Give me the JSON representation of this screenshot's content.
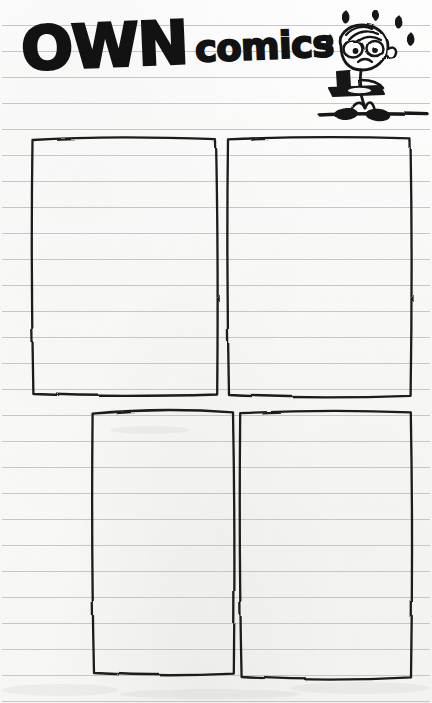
{
  "page": {
    "kind": "draw-your-own-comics-worksheet",
    "width": 432,
    "height": 703,
    "paper_color": "#fbfbfa",
    "ink_color": "#121212",
    "rule_color": "#b9bcc0"
  },
  "header": {
    "title_primary": "OWN",
    "title_secondary": "comics",
    "title_full": "OWN comics",
    "tilt_degrees": -2.4
  },
  "mascot": {
    "name": "worried-stick-boy-with-lunch-tray",
    "description": "stick figure walking with a cafeteria tray, sweat drops around head",
    "sweat_drop_count": 5,
    "expression": "worried",
    "carrying": "lunch tray with cup and plate",
    "ground_line": true
  },
  "ruled_paper": {
    "line_spacing": 26,
    "first_line_y": 25,
    "line_count": 27,
    "line_color": "#c3c6ca",
    "margin_left": 2,
    "margin_right": 430
  },
  "panels": [
    {
      "id": "panel-1",
      "label": "Comic panel 1",
      "position": "top-left",
      "empty": true
    },
    {
      "id": "panel-2",
      "label": "Comic panel 2",
      "position": "top-right",
      "empty": true
    },
    {
      "id": "panel-3",
      "label": "Comic panel 3",
      "position": "bottom-left",
      "empty": true
    },
    {
      "id": "panel-4",
      "label": "Comic panel 4",
      "position": "bottom-right",
      "empty": true
    }
  ]
}
